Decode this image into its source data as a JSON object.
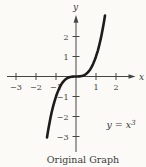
{
  "figure": {
    "caption": "Original Graph",
    "equation_base": "y = x",
    "equation_exponent": "3"
  },
  "colors": {
    "background": "#fbfaf6",
    "ink": "#3a3a3a",
    "axis_ink": "#454545",
    "curve_ink": "#1c1c1c"
  },
  "chart_data": {
    "type": "line",
    "title": "Original Graph",
    "function": "y = x^3",
    "equation_label": "y = x³",
    "x_label": "x",
    "y_label": "y",
    "x_ticks": {
      "values": [
        -3,
        -2,
        -1,
        1,
        2
      ],
      "labels": [
        "−3",
        "−2",
        "−1",
        "1",
        "2"
      ]
    },
    "y_ticks": {
      "values": [
        -3,
        -2,
        -1,
        1,
        2
      ],
      "labels": [
        "−3",
        "−2",
        "−1",
        "1",
        "2"
      ]
    },
    "xlim": [
      -3.5,
      2.9
    ],
    "ylim": [
      -3.1,
      3.1
    ],
    "curve_x_range": [
      -1.45,
      1.45
    ],
    "sample_points": [
      {
        "x": -1.4,
        "y": -2.74
      },
      {
        "x": -1,
        "y": -1
      },
      {
        "x": 0,
        "y": 0
      },
      {
        "x": 1,
        "y": 1
      },
      {
        "x": 1.4,
        "y": 2.74
      }
    ],
    "grid": false,
    "legend": false
  }
}
